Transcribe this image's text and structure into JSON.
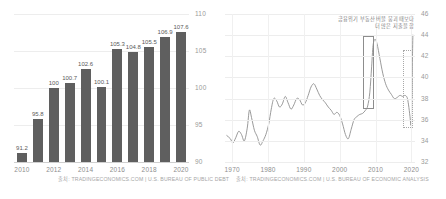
{
  "left_panel": {
    "source": "출처: TRADINGECONOMICS.COM | U.S. BUREAU OF PUBLIC DEBT"
  },
  "right_panel": {
    "source": "출처: TRADINGECONOMICS.COM | U.S. BUREAU OF ECONOMIC ANALYSIS",
    "annotation_line1": "금융위기 부동산 버블 붕괴 때보다",
    "annotation_line2": "더 많은 지출을 함"
  },
  "chart_data": [
    {
      "type": "bar",
      "title": "",
      "xlabel": "",
      "ylabel": "",
      "categories": [
        2010,
        2011,
        2012,
        2013,
        2014,
        2015,
        2016,
        2017,
        2018,
        2019,
        2020
      ],
      "values": [
        91.2,
        95.8,
        100,
        100.7,
        102.6,
        100.1,
        105.3,
        104.8,
        105.5,
        106.9,
        107.6
      ],
      "value_labels": [
        "91.2",
        "95.8",
        "100",
        "100.7",
        "102.6",
        "100.1",
        "105.3",
        "104.8",
        "105.5",
        "106.9",
        "107.6"
      ],
      "xticks": [
        "2010",
        "2012",
        "2014",
        "2016",
        "2018",
        "2020"
      ],
      "xtick_values": [
        2010,
        2012,
        2014,
        2016,
        2018,
        2020
      ],
      "yticks": [
        "90",
        "95",
        "100",
        "105",
        "110"
      ],
      "ytick_values": [
        90,
        95,
        100,
        105,
        110
      ],
      "ylim": [
        90,
        110
      ],
      "grid": true,
      "legend": "none",
      "bar_color": "#5f5f5f"
    },
    {
      "type": "line",
      "title": "",
      "xlabel": "",
      "ylabel": "",
      "xticks": [
        "1970",
        "1980",
        "1990",
        "2000",
        "2010",
        "2020"
      ],
      "xtick_values": [
        1970,
        1980,
        1990,
        2000,
        2010,
        2020
      ],
      "yticks": [
        "32",
        "34",
        "36",
        "38",
        "40",
        "42",
        "44",
        "46"
      ],
      "ytick_values": [
        32,
        34,
        36,
        38,
        40,
        42,
        44,
        46
      ],
      "ylim": [
        32,
        46
      ],
      "xlim": [
        1968,
        2021
      ],
      "grid": true,
      "legend": "none",
      "line_color": "#8f8f8f",
      "x": [
        1968.5,
        1969.5,
        1970.2,
        1971.0,
        1971.8,
        1972.6,
        1973.4,
        1974.2,
        1974.8,
        1975.4,
        1976.2,
        1977.0,
        1977.8,
        1978.6,
        1979.4,
        1980.2,
        1980.9,
        1981.6,
        1982.4,
        1983.2,
        1984.0,
        1984.8,
        1985.6,
        1986.4,
        1987.2,
        1988.0,
        1988.8,
        1989.6,
        1990.4,
        1991.2,
        1992.0,
        1992.8,
        1993.6,
        1994.4,
        1995.2,
        1996.0,
        1996.8,
        1997.6,
        1998.4,
        1999.2,
        2000.0,
        2000.8,
        2001.6,
        2002.4,
        2003.2,
        2004.0,
        2004.8,
        2005.6,
        2006.4,
        2007.2,
        2007.8,
        2008.4,
        2008.9,
        2009.3,
        2009.8,
        2010.4,
        2011.2,
        2012.0,
        2012.8,
        2013.6,
        2014.4,
        2015.2,
        2016.0,
        2016.8,
        2017.6,
        2018.2,
        2018.8,
        2019.2,
        2019.6,
        2019.9,
        2020.1,
        2020.25,
        2020.4
      ],
      "y": [
        34.5,
        34.2,
        33.8,
        34.3,
        34.9,
        34.6,
        34.0,
        35.2,
        36.9,
        36.2,
        35.0,
        34.4,
        33.6,
        34.0,
        34.6,
        35.6,
        37.0,
        38.0,
        37.8,
        37.2,
        37.5,
        38.2,
        37.6,
        37.0,
        37.4,
        38.0,
        37.9,
        37.4,
        37.6,
        38.3,
        39.1,
        39.4,
        38.9,
        38.3,
        37.9,
        37.6,
        37.2,
        36.9,
        36.5,
        36.7,
        36.4,
        35.6,
        34.6,
        34.2,
        35.1,
        36.0,
        36.3,
        36.5,
        36.6,
        36.9,
        37.3,
        38.6,
        41.0,
        43.0,
        43.6,
        43.2,
        41.8,
        40.4,
        39.4,
        38.8,
        38.4,
        38.0,
        38.1,
        38.3,
        38.2,
        38.3,
        38.1,
        37.4,
        36.3,
        35.5,
        37.5,
        41.0,
        44.0
      ]
    }
  ]
}
